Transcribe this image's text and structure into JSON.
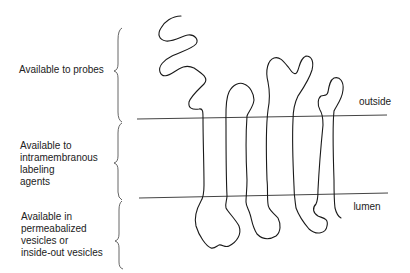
{
  "diagram": {
    "type": "membrane-topology",
    "stroke_color": "#1a1a1a",
    "membrane_line_color": "#444444",
    "regions": [
      {
        "id": "probes",
        "lines": [
          "Available to probes"
        ]
      },
      {
        "id": "intramembranous",
        "lines": [
          "Available to",
          "intramembranous",
          "labeling",
          "agents"
        ]
      },
      {
        "id": "permeabilized",
        "lines": [
          "Available in",
          "permeabalized",
          "vesicles or",
          "inside-out vesicles"
        ]
      }
    ],
    "side_labels": {
      "outside": "outside",
      "lumen": "lumen"
    }
  }
}
